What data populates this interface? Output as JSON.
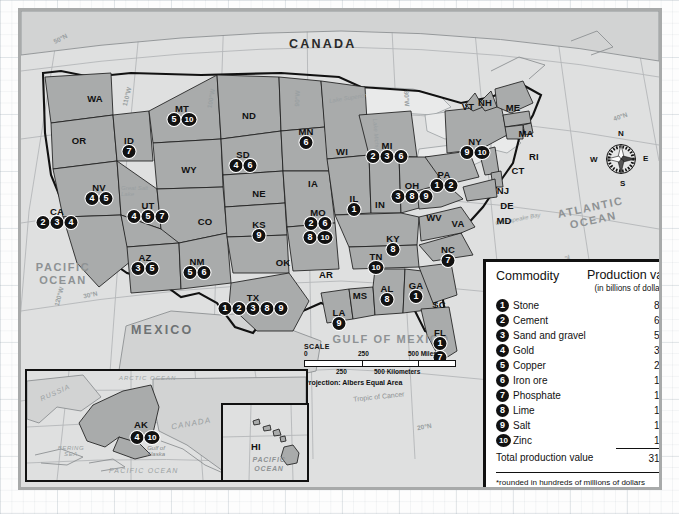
{
  "map": {
    "title_country_canada": "CANADA",
    "title_country_mexico": "MEXICO",
    "oceans": [
      {
        "name": "PACIFIC OCEAN",
        "line1": "PACIFIC",
        "line2": "OCEAN"
      },
      {
        "name": "ATLANTIC OCEAN",
        "line1": "ATLANTIC",
        "line2": "OCEAN"
      },
      {
        "name": "GULF OF MEXICO",
        "line1": "GULF OF MEXICO",
        "line2": ""
      }
    ],
    "graticule_labels": [
      "50°N",
      "40°N",
      "30°N",
      "20°N",
      "120°W",
      "110°W",
      "100°W",
      "90°W",
      "80°W",
      "70°W"
    ],
    "tropic_label": "Tropic of Cancer",
    "lake_labels": [
      "Lake Superior",
      "Lake Michigan",
      "Great Salt Lake",
      "Chesapeake Bay"
    ],
    "compass": {
      "n": "N",
      "e": "E",
      "s": "S",
      "w": "W"
    },
    "scale": {
      "title": "SCALE",
      "miles": [
        "0",
        "250",
        "500 Miles"
      ],
      "kilometers": [
        "0",
        "250",
        "500 Kilometers"
      ],
      "projection": "Projection: Albers Equal Area"
    },
    "states": [
      {
        "abbr": "WA",
        "x": 74,
        "y": 82,
        "dots": []
      },
      {
        "abbr": "OR",
        "x": 58,
        "y": 124,
        "dots": []
      },
      {
        "abbr": "ID",
        "x": 108,
        "y": 124,
        "dots": [
          "7"
        ]
      },
      {
        "abbr": "MT",
        "x": 161,
        "y": 92,
        "dots": [
          "5",
          "10"
        ]
      },
      {
        "abbr": "WY",
        "x": 168,
        "y": 153,
        "dots": []
      },
      {
        "abbr": "NV",
        "x": 78,
        "y": 171,
        "dots": [
          "4",
          "5"
        ]
      },
      {
        "abbr": "UT",
        "x": 127,
        "y": 189,
        "dots": [
          "4",
          "5",
          "7"
        ]
      },
      {
        "abbr": "CA",
        "x": 36,
        "y": 195,
        "dots": [
          "2",
          "3",
          "4"
        ]
      },
      {
        "abbr": "AZ",
        "x": 124,
        "y": 241,
        "dots": [
          "3",
          "5"
        ]
      },
      {
        "abbr": "NM",
        "x": 176,
        "y": 245,
        "dots": [
          "5",
          "6"
        ]
      },
      {
        "abbr": "CO",
        "x": 184,
        "y": 205,
        "dots": []
      },
      {
        "abbr": "ND",
        "x": 228,
        "y": 99,
        "dots": []
      },
      {
        "abbr": "SD",
        "x": 222,
        "y": 138,
        "dots": [
          "4",
          "6"
        ]
      },
      {
        "abbr": "NE",
        "x": 238,
        "y": 177,
        "dots": []
      },
      {
        "abbr": "KS",
        "x": 238,
        "y": 208,
        "dots": [
          "9"
        ]
      },
      {
        "abbr": "OK",
        "x": 262,
        "y": 246,
        "dots": []
      },
      {
        "abbr": "TX",
        "x": 232,
        "y": 281,
        "dots": [
          "1",
          "2",
          "3",
          "8",
          "9"
        ]
      },
      {
        "abbr": "MN",
        "x": 285,
        "y": 115,
        "dots": [
          "6"
        ]
      },
      {
        "abbr": "IA",
        "x": 292,
        "y": 167,
        "dots": []
      },
      {
        "abbr": "MO",
        "x": 297,
        "y": 196,
        "dots": [
          "2",
          "6",
          "8",
          "10"
        ]
      },
      {
        "abbr": "AR",
        "x": 305,
        "y": 258,
        "dots": []
      },
      {
        "abbr": "LA",
        "x": 318,
        "y": 296,
        "dots": [
          "9"
        ]
      },
      {
        "abbr": "MS",
        "x": 339,
        "y": 279,
        "dots": []
      },
      {
        "abbr": "WI",
        "x": 321,
        "y": 135,
        "dots": []
      },
      {
        "abbr": "IL",
        "x": 333,
        "y": 182,
        "dots": [
          "1"
        ]
      },
      {
        "abbr": "IN",
        "x": 359,
        "y": 188,
        "dots": []
      },
      {
        "abbr": "MI",
        "x": 366,
        "y": 129,
        "dots": [
          "2",
          "3",
          "6"
        ]
      },
      {
        "abbr": "OH",
        "x": 391,
        "y": 169,
        "dots": [
          "3",
          "8",
          "9"
        ]
      },
      {
        "abbr": "KY",
        "x": 372,
        "y": 222,
        "dots": [
          "8"
        ]
      },
      {
        "abbr": "TN",
        "x": 355,
        "y": 240,
        "dots": [
          "10"
        ]
      },
      {
        "abbr": "AL",
        "x": 366,
        "y": 272,
        "dots": [
          "8"
        ]
      },
      {
        "abbr": "GA",
        "x": 395,
        "y": 269,
        "dots": [
          "1"
        ]
      },
      {
        "abbr": "FL",
        "x": 419,
        "y": 316,
        "dots": [
          "1",
          "7"
        ]
      },
      {
        "abbr": "SC",
        "x": 418,
        "y": 288,
        "dots": []
      },
      {
        "abbr": "NC",
        "x": 427,
        "y": 233,
        "dots": [
          "7"
        ]
      },
      {
        "abbr": "VA",
        "x": 437,
        "y": 207,
        "dots": []
      },
      {
        "abbr": "WV",
        "x": 413,
        "y": 201,
        "dots": []
      },
      {
        "abbr": "PA",
        "x": 423,
        "y": 158,
        "dots": [
          "1",
          "2"
        ]
      },
      {
        "abbr": "NY",
        "x": 454,
        "y": 125,
        "dots": [
          "9",
          "10"
        ]
      },
      {
        "abbr": "VT",
        "x": 447,
        "y": 90,
        "dots": []
      },
      {
        "abbr": "NH",
        "x": 464,
        "y": 86,
        "dots": []
      },
      {
        "abbr": "ME",
        "x": 492,
        "y": 91,
        "dots": []
      },
      {
        "abbr": "MA",
        "x": 505,
        "y": 117,
        "dots": []
      },
      {
        "abbr": "RI",
        "x": 513,
        "y": 140,
        "dots": []
      },
      {
        "abbr": "CT",
        "x": 497,
        "y": 154,
        "dots": []
      },
      {
        "abbr": "NJ",
        "x": 482,
        "y": 174,
        "dots": []
      },
      {
        "abbr": "DE",
        "x": 486,
        "y": 189,
        "dots": []
      },
      {
        "abbr": "MD",
        "x": 483,
        "y": 204,
        "dots": []
      }
    ],
    "insets": [
      {
        "name": "alaska",
        "label": "AK",
        "dots": [
          "4",
          "10"
        ],
        "extra_labels": [
          "RUSSIA",
          "CANADA",
          "BERING SEA",
          "Gulf of Alaska",
          "PACIFIC OCEAN",
          "ARCTIC OCEAN"
        ]
      },
      {
        "name": "hawaii",
        "label": "HI",
        "dots": [],
        "extra_labels": [
          "PACIFIC OCEAN"
        ]
      }
    ]
  },
  "legend": {
    "header_commodity": "Commodity",
    "header_value": "Production value",
    "header_value_sub": "(in billions of dollars)*",
    "rows": [
      {
        "n": "1",
        "commodity": "Stone",
        "value": "8.2"
      },
      {
        "n": "2",
        "commodity": "Cement",
        "value": "6.3"
      },
      {
        "n": "3",
        "commodity": "Sand and gravel",
        "value": "5.3"
      },
      {
        "n": "4",
        "commodity": "Gold",
        "value": "3.0"
      },
      {
        "n": "5",
        "commodity": "Copper",
        "value": "2.7"
      },
      {
        "n": "6",
        "commodity": "Iron ore",
        "value": "1.6"
      },
      {
        "n": "7",
        "commodity": "Phosphate",
        "value": "1.2"
      },
      {
        "n": "8",
        "commodity": "Lime",
        "value": "1.2"
      },
      {
        "n": "9",
        "commodity": "Salt",
        "value": "1.1"
      },
      {
        "n": "10",
        "commodity": "Zinc",
        "value": "1.0"
      }
    ],
    "total_label": "Total production value",
    "total_value": "31.6",
    "footnote": "*rounded in hundreds of millions of dollars"
  },
  "colors": {
    "state_fill": "#a9abab",
    "land_fill": "#d2d3d3",
    "plate_bg": "#dfe0e0",
    "dot_bg": "#111111",
    "legend_border": "#111111"
  }
}
